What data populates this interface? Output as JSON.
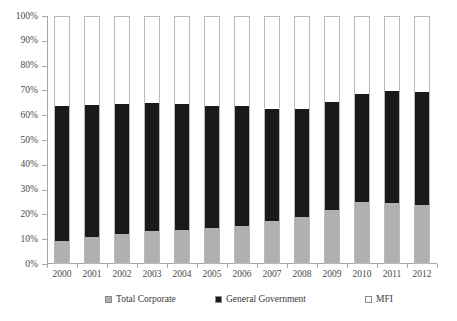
{
  "chart_data": {
    "type": "bar",
    "subtype": "stacked-100-percent",
    "title": "",
    "xlabel": "",
    "ylabel": "",
    "ylim": [
      0,
      100
    ],
    "ytick_labels": [
      "0%",
      "10%",
      "20%",
      "30%",
      "40%",
      "50%",
      "60%",
      "70%",
      "80%",
      "90%",
      "100%"
    ],
    "ytick_values": [
      0,
      10,
      20,
      30,
      40,
      50,
      60,
      70,
      80,
      90,
      100
    ],
    "grid": false,
    "legend_position": "bottom",
    "categories": [
      "2000",
      "2001",
      "2002",
      "2003",
      "2004",
      "2005",
      "2006",
      "2007",
      "2008",
      "2009",
      "2010",
      "2011",
      "2012"
    ],
    "series": [
      {
        "name": "Total Corporate",
        "color": "#b0b0b0",
        "values": [
          9.0,
          10.5,
          11.5,
          13.0,
          13.5,
          14.0,
          15.0,
          17.0,
          18.5,
          21.5,
          24.5,
          24.0,
          23.5
        ]
      },
      {
        "name": "General Government",
        "color": "#1a1a1a",
        "values": [
          54.5,
          53.3,
          52.5,
          51.5,
          50.8,
          49.5,
          48.3,
          45.0,
          43.8,
          43.5,
          43.5,
          45.5,
          45.5
        ]
      },
      {
        "name": "MFI",
        "color": "#ffffff",
        "values": [
          36.5,
          36.2,
          36.0,
          35.5,
          35.7,
          36.5,
          36.7,
          38.0,
          37.7,
          35.0,
          32.0,
          30.5,
          31.0
        ]
      }
    ],
    "cumulative_tops": {
      "corporate_plus_government": [
        63.5,
        63.8,
        64.0,
        64.5,
        64.3,
        63.5,
        63.3,
        62.0,
        62.3,
        65.0,
        68.0,
        69.5,
        69.0
      ]
    }
  },
  "legend": {
    "items": [
      {
        "label": "Total Corporate",
        "color": "#b0b0b0"
      },
      {
        "label": "General Government",
        "color": "#1a1a1a"
      },
      {
        "label": "MFI",
        "color": "#ffffff"
      }
    ]
  },
  "colors": {
    "corporate": "#b0b0b0",
    "government": "#1a1a1a",
    "mfi": "#ffffff",
    "axis": "#a8a8a8",
    "bar_outline": "#b9b9b9",
    "text": "#3a3a3a",
    "background": "#ffffff"
  }
}
